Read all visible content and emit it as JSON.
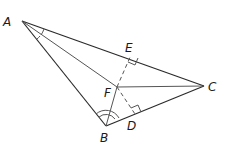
{
  "diagram": {
    "type": "triangle-with-angle-bisectors",
    "points": {
      "A": {
        "label": "A",
        "x": 22,
        "y": 21
      },
      "B": {
        "label": "B",
        "x": 106,
        "y": 126
      },
      "C": {
        "label": "C",
        "x": 204,
        "y": 86
      },
      "F": {
        "label": "F",
        "x": 117,
        "y": 87
      },
      "E": {
        "label": "E",
        "x": 131,
        "y": 55
      },
      "D": {
        "label": "D",
        "x": 135,
        "y": 114
      }
    },
    "labels": {
      "A": "A",
      "B": "B",
      "C": "C",
      "D": "D",
      "E": "E",
      "F": "F"
    },
    "segments": [
      {
        "from": "A",
        "to": "B",
        "style": "solid"
      },
      {
        "from": "B",
        "to": "C",
        "style": "solid"
      },
      {
        "from": "A",
        "to": "C",
        "style": "solid"
      },
      {
        "from": "A",
        "to": "F",
        "style": "solid"
      },
      {
        "from": "B",
        "to": "F",
        "style": "solid"
      },
      {
        "from": "F",
        "to": "C",
        "style": "solid"
      },
      {
        "from": "F",
        "to": "E",
        "style": "dashed"
      },
      {
        "from": "F",
        "to": "D",
        "style": "dashed"
      }
    ],
    "right_angles": [
      "E",
      "D"
    ],
    "angle_marks": [
      {
        "vertex": "A",
        "arcs": 1,
        "congruent_halves": true
      },
      {
        "vertex": "B",
        "arcs": 2,
        "congruent_halves": true
      }
    ]
  }
}
